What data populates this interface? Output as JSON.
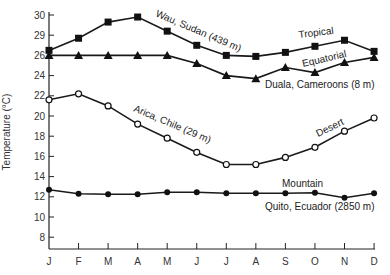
{
  "chart_data": {
    "type": "line",
    "title": "",
    "xlabel": "",
    "ylabel": "Temperature (°C)",
    "categories": [
      "J",
      "F",
      "M",
      "A",
      "M",
      "J",
      "J",
      "A",
      "S",
      "O",
      "N",
      "D"
    ],
    "yticks": [
      8,
      10,
      12,
      14,
      16,
      18,
      20,
      22,
      24,
      26,
      28,
      30
    ],
    "ytick_labels": [
      "8",
      "10",
      "12",
      "14",
      "16",
      "18",
      "20",
      "22",
      "24",
      "26",
      "29",
      "30"
    ],
    "ylim": [
      6.8,
      30.3
    ],
    "grid": false,
    "legend": "none (inline labels)",
    "series": [
      {
        "name": "Wau, Sudan (439 m)",
        "climate": "Tropical",
        "marker": "filled-square",
        "values": [
          26.5,
          27.7,
          29.3,
          29.8,
          28.4,
          27.0,
          26.0,
          25.9,
          26.3,
          26.9,
          27.5,
          26.4
        ]
      },
      {
        "name": "Duala, Cameroons (8 m)",
        "climate": "Equatorial",
        "marker": "filled-triangle",
        "values": [
          26.0,
          26.0,
          26.0,
          26.0,
          26.0,
          25.2,
          24.0,
          23.7,
          24.8,
          24.3,
          25.3,
          25.8
        ]
      },
      {
        "name": "Arica, Chile (29 m)",
        "climate": "Desert",
        "marker": "open-circle",
        "values": [
          21.6,
          22.2,
          21.0,
          19.2,
          17.8,
          16.4,
          15.2,
          15.2,
          15.9,
          16.9,
          18.5,
          19.8
        ]
      },
      {
        "name": "Quito, Ecuador (2850 m)",
        "climate": "Mountain",
        "marker": "filled-circle",
        "values": [
          12.7,
          12.3,
          12.25,
          12.25,
          12.45,
          12.45,
          12.35,
          12.35,
          12.35,
          12.4,
          11.9,
          12.35
        ]
      }
    ],
    "annotations": {
      "wau": "Wau, Sudan (439 m)",
      "tropical": "Tropical",
      "equatorial": "Equatorial",
      "duala": "Duala, Cameroons (8 m)",
      "arica": "Arica, Chile (29 m)",
      "desert": "Desert",
      "mountain": "Mountain",
      "quito": "Quito, Ecuador (2850 m)"
    }
  }
}
